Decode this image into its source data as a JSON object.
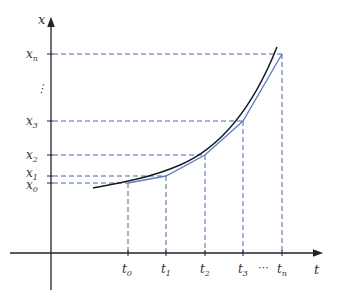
{
  "diagram": {
    "type": "euler-method-approximation",
    "axes": {
      "y_label": "x",
      "x_label": "t"
    },
    "x_ticks": [
      {
        "base": "t",
        "sub": "0",
        "x": 128
      },
      {
        "base": "t",
        "sub": "1",
        "x": 166
      },
      {
        "base": "t",
        "sub": "2",
        "x": 205
      },
      {
        "base": "t",
        "sub": "3",
        "x": 243
      },
      {
        "base": "t",
        "sub": "n",
        "x": 282
      }
    ],
    "x_ellipsis": "⋯",
    "y_ticks": [
      {
        "base": "x",
        "sub": "n",
        "y": 54
      },
      {
        "base": "x",
        "sub": "3",
        "y": 121
      },
      {
        "base": "x",
        "sub": "2",
        "y": 155
      },
      {
        "base": "x",
        "sub": "1",
        "y": 176
      },
      {
        "base": "x",
        "sub": "0",
        "y": 183
      }
    ],
    "y_ellipsis": "⋮",
    "colors": {
      "axis": "#222222",
      "curve": "#1a1a1a",
      "approximation": "#5b7fc7",
      "guides": "#4a66b0"
    }
  }
}
